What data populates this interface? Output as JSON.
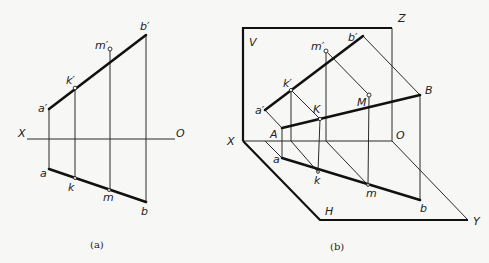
{
  "figure_a": {
    "caption": "(a)",
    "labels": {
      "a_prime": "a′",
      "b_prime": "b′",
      "k_prime": "k′",
      "m_prime": "m′",
      "a": "a",
      "b": "b",
      "k": "k",
      "m": "m",
      "X": "X",
      "O": "O"
    }
  },
  "figure_b": {
    "caption": "(b)",
    "labels": {
      "V": "V",
      "Z": "Z",
      "H": "H",
      "X": "X",
      "O": "O",
      "Y": "Y",
      "a_prime": "a′",
      "b_prime": "b′",
      "k_prime": "k′",
      "m_prime": "m′",
      "A": "A",
      "B": "B",
      "K": "K",
      "M": "M",
      "a": "a",
      "b": "b",
      "k": "k",
      "m": "m"
    }
  }
}
